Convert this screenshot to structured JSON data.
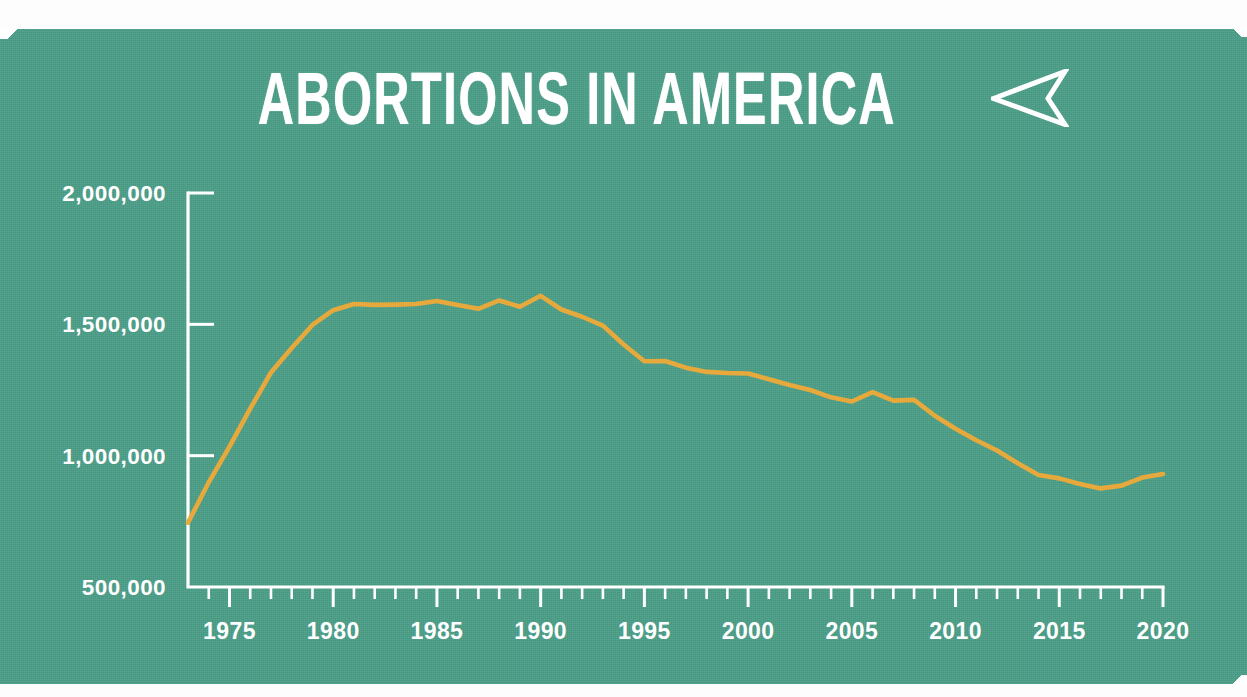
{
  "card": {
    "background_color": "#4a9e87",
    "line_color": "#e8a93c",
    "text_color": "#ffffff"
  },
  "header": {
    "title": "ABORTIONS IN AMERICA",
    "arrow_icon": "dart-arrow-left-icon"
  },
  "chart_data": {
    "type": "line",
    "title": "ABORTIONS IN AMERICA",
    "xlabel": "",
    "ylabel": "",
    "xlim": [
      1973,
      2020
    ],
    "ylim": [
      500000,
      2000000
    ],
    "grid": false,
    "legend": null,
    "x_tick_labels": [
      "1975",
      "1980",
      "1985",
      "1990",
      "1995",
      "2000",
      "2005",
      "2010",
      "2015",
      "2020"
    ],
    "x_major_ticks": [
      1975,
      1980,
      1985,
      1990,
      1995,
      2000,
      2005,
      2010,
      2015,
      2020
    ],
    "x_minor_tick_step": 1,
    "y_tick_labels": [
      "2,000,000",
      "1,500,000",
      "1,000,000",
      "500,000"
    ],
    "y_ticks": [
      2000000,
      1500000,
      1000000,
      500000
    ],
    "series": [
      {
        "name": "Abortions in America",
        "color": "#e8a93c",
        "x": [
          1973,
          1974,
          1975,
          1976,
          1977,
          1978,
          1979,
          1980,
          1981,
          1982,
          1983,
          1984,
          1985,
          1986,
          1987,
          1988,
          1989,
          1990,
          1991,
          1992,
          1993,
          1994,
          1995,
          1996,
          1997,
          1998,
          1999,
          2000,
          2001,
          2002,
          2003,
          2004,
          2005,
          2006,
          2007,
          2008,
          2009,
          2010,
          2011,
          2012,
          2013,
          2014,
          2015,
          2016,
          2017,
          2018,
          2019,
          2020
        ],
        "values": [
          744600,
          898600,
          1034200,
          1179300,
          1316700,
          1409600,
          1497700,
          1553900,
          1577300,
          1573900,
          1575000,
          1577200,
          1588600,
          1574000,
          1559100,
          1590800,
          1566900,
          1608600,
          1556500,
          1528900,
          1495000,
          1423000,
          1359400,
          1360200,
          1335000,
          1319000,
          1314800,
          1312990,
          1291000,
          1269000,
          1250000,
          1222100,
          1206200,
          1242200,
          1209600,
          1212400,
          1152000,
          1102700,
          1058500,
          1019500,
          971000,
          926200,
          913500,
          892000,
          875400,
          886000,
          916500,
          930200
        ]
      }
    ]
  }
}
